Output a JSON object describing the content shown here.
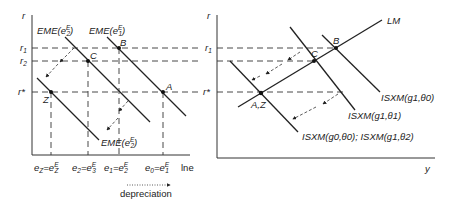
{
  "left_panel": {
    "y_axis_label": "r",
    "x_axis_label": "lne",
    "y_ticks": {
      "r1": "r",
      "r1_sub": "1",
      "r2": "r",
      "r2_sub": "2",
      "rstar": "r*"
    },
    "curves": {
      "eme_e2_upper": {
        "prefix": "EME(e",
        "sub": "2",
        "sup": "E",
        "suffix": ")"
      },
      "eme_e1": {
        "prefix": "EME(e",
        "sub": "1",
        "sup": "E",
        "suffix": ")"
      },
      "eme_e2_lower": {
        "prefix": "EME(e",
        "sub": "2",
        "sup": "E",
        "suffix": ")"
      }
    },
    "points": {
      "A": "A",
      "B": "B",
      "C": "C",
      "Z": "Z"
    },
    "x_ticks": [
      {
        "lhs": "e",
        "lhs_sub": "Z",
        "rhs": "e",
        "rhs_sub": "Z",
        "rhs_sup": "E"
      },
      {
        "lhs": "e",
        "lhs_sub": "2",
        "rhs": "e",
        "rhs_sub": "3",
        "rhs_sup": "E"
      },
      {
        "lhs": "e",
        "lhs_sub": "1",
        "rhs": "e",
        "rhs_sub": "2",
        "rhs_sup": "E"
      },
      {
        "lhs": "e",
        "lhs_sub": "0",
        "rhs": "e",
        "rhs_sub": "1",
        "rhs_sup": "E"
      }
    ],
    "annotation": "depreciation"
  },
  "right_panel": {
    "y_axis_label": "r",
    "x_axis_label": "y",
    "y_ticks": {
      "r1": "r",
      "r1_sub": "1",
      "rstar": "r*"
    },
    "curves": {
      "lm": "LM",
      "isxm_g1_theta0": "ISXM(g1,θ0)",
      "isxm_g1_theta1": "ISXM(g1,θ1)",
      "isxm_g0_theta0_g1_theta2": "ISXM(g0,θ0); ISXM(g1,θ2)"
    },
    "points": {
      "AZ": "A,Z",
      "B": "B",
      "C": "C"
    }
  }
}
